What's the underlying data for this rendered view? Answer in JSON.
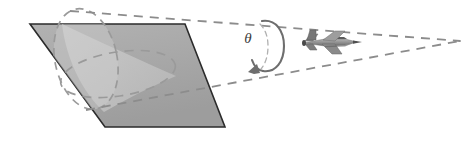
{
  "figure": {
    "labels": {
      "theta": "θ"
    },
    "colors": {
      "background": "#ffffff",
      "plane_fill_dark": "#a6a6a6",
      "plane_fill_light": "#c9c9c9",
      "plane_stroke": "#2b2b2b",
      "dashed_stroke": "#8c8c8c",
      "cone_dash_stroke": "#9a9a9a",
      "arrow_stroke": "#6e6e6e",
      "aircraft_body": "#8f8f8f",
      "aircraft_dark": "#5f5f5f",
      "aircraft_light": "#b9b9b9",
      "text": "#3b3b3b"
    },
    "elements": [
      {
        "name": "ground-plane-parallelogram",
        "kind": "filled-polygon"
      },
      {
        "name": "cone-base-ellipse",
        "kind": "dashed-ellipse"
      },
      {
        "name": "cone-plane-intersection-ellipse",
        "kind": "dashed-ellipse"
      },
      {
        "name": "cone-upper-generator-line",
        "kind": "dashed-line"
      },
      {
        "name": "cone-lower-generator-line",
        "kind": "dashed-line"
      },
      {
        "name": "rotation-arrow",
        "kind": "arc-with-arrowhead"
      },
      {
        "name": "theta-angle-label",
        "kind": "text"
      },
      {
        "name": "aircraft-icon",
        "kind": "sprite"
      },
      {
        "name": "cone-apex-vertex",
        "kind": "point"
      }
    ],
    "geometry": {
      "plane_vertices": [
        [
          30,
          24
        ],
        [
          185,
          24
        ],
        [
          225,
          127
        ],
        [
          105,
          127
        ]
      ],
      "cone_apex": [
        460,
        41
      ],
      "cone_base_center": [
        86,
        59
      ],
      "cone_base_rx": 31,
      "cone_base_ry": 51,
      "cone_base_rotation_deg": -12,
      "intersection_center": [
        118,
        74
      ],
      "intersection_rx": 58,
      "intersection_ry": 22,
      "intersection_rotation_deg": -9,
      "upper_generator": [
        [
          70,
          11
        ],
        [
          460,
          41
        ]
      ],
      "lower_generator": [
        [
          86,
          110
        ],
        [
          460,
          41
        ]
      ],
      "rotation_arc_center": [
        268,
        46
      ],
      "rotation_arc_rx": 15,
      "rotation_arc_ry": 26,
      "aircraft_center": [
        331,
        42
      ],
      "theta_label_position": [
        246,
        40
      ]
    }
  }
}
